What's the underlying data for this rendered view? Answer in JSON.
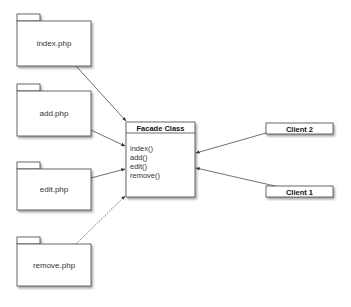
{
  "diagram": {
    "type": "facade-pattern",
    "packages": [
      {
        "id": "index",
        "label": "index.php"
      },
      {
        "id": "add",
        "label": "add.php"
      },
      {
        "id": "edit",
        "label": "edit.php"
      },
      {
        "id": "remove",
        "label": "remove.php"
      }
    ],
    "facade": {
      "title": "Facade Class",
      "methods": [
        "index()",
        "add()",
        "edit()",
        "remove()"
      ]
    },
    "clients": [
      {
        "id": "client2",
        "label": "Client 2"
      },
      {
        "id": "client1",
        "label": "Client 1"
      }
    ],
    "edges": [
      {
        "from": "index",
        "to": "facade",
        "style": "solid"
      },
      {
        "from": "add",
        "to": "facade",
        "style": "solid"
      },
      {
        "from": "edit",
        "to": "facade",
        "style": "solid"
      },
      {
        "from": "remove",
        "to": "facade",
        "style": "dotted"
      },
      {
        "from": "client2",
        "to": "facade",
        "style": "solid"
      },
      {
        "from": "client1",
        "to": "facade",
        "style": "solid"
      }
    ],
    "colors": {
      "stroke": "#444444",
      "fill": "#ffffff",
      "shadow": "#9a9a9a"
    }
  }
}
